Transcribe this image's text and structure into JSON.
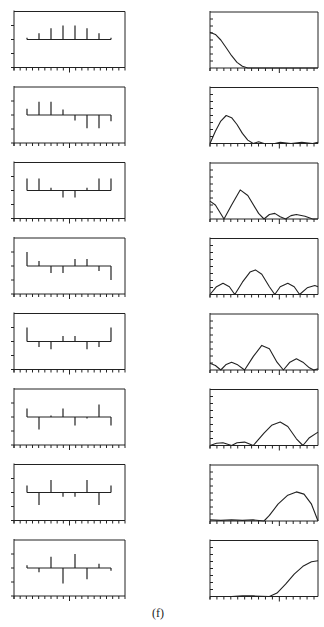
{
  "caption": "(f)",
  "chart_data": {
    "type": "line",
    "title": "",
    "layout": {
      "rows": 8,
      "columns": 2,
      "left_panel": "stem plot (8 samples)",
      "right_panel": "magnitude response curve"
    },
    "stems": [
      [
        0.12,
        0.45,
        0.8,
        1.0,
        1.0,
        0.8,
        0.45,
        0.12
      ],
      [
        0.45,
        0.95,
        0.95,
        0.4,
        -0.4,
        -0.95,
        -0.95,
        -0.45
      ],
      [
        0.85,
        0.85,
        0.2,
        -0.5,
        -0.5,
        0.2,
        0.85,
        0.85
      ],
      [
        1.0,
        0.35,
        -0.5,
        -0.5,
        0.5,
        0.5,
        -0.35,
        -1.0
      ],
      [
        1.0,
        -0.4,
        -0.55,
        0.4,
        0.4,
        -0.55,
        -0.4,
        1.0
      ],
      [
        0.6,
        -0.9,
        0.1,
        0.6,
        -0.6,
        -0.1,
        0.9,
        -0.6
      ],
      [
        0.5,
        -0.9,
        0.9,
        -0.3,
        -0.3,
        0.9,
        -0.9,
        0.5
      ],
      [
        0.2,
        -0.3,
        0.8,
        -1.1,
        1.0,
        -0.8,
        0.3,
        -0.2
      ]
    ],
    "responses": [
      [
        [
          0,
          0.64
        ],
        [
          0.05,
          0.6
        ],
        [
          0.1,
          0.5
        ],
        [
          0.15,
          0.36
        ],
        [
          0.2,
          0.22
        ],
        [
          0.25,
          0.1
        ],
        [
          0.3,
          0.03
        ],
        [
          0.35,
          0
        ],
        [
          1,
          0
        ]
      ],
      [
        [
          0,
          0
        ],
        [
          0.05,
          0.22
        ],
        [
          0.1,
          0.4
        ],
        [
          0.15,
          0.5
        ],
        [
          0.2,
          0.46
        ],
        [
          0.25,
          0.34
        ],
        [
          0.3,
          0.18
        ],
        [
          0.35,
          0.06
        ],
        [
          0.4,
          0
        ],
        [
          0.45,
          0.03
        ],
        [
          0.5,
          0
        ],
        [
          0.6,
          0
        ],
        [
          0.65,
          0.02
        ],
        [
          0.75,
          0
        ],
        [
          0.85,
          0.02
        ],
        [
          0.95,
          0
        ],
        [
          1,
          0.02
        ]
      ],
      [
        [
          0,
          0.32
        ],
        [
          0.05,
          0.25
        ],
        [
          0.13,
          0
        ],
        [
          0.2,
          0.25
        ],
        [
          0.28,
          0.52
        ],
        [
          0.35,
          0.42
        ],
        [
          0.45,
          0.1
        ],
        [
          0.5,
          0
        ],
        [
          0.55,
          0.08
        ],
        [
          0.6,
          0.1
        ],
        [
          0.65,
          0.04
        ],
        [
          0.7,
          0
        ],
        [
          0.75,
          0.06
        ],
        [
          0.8,
          0.08
        ],
        [
          0.88,
          0.05
        ],
        [
          0.95,
          0
        ],
        [
          1,
          0
        ]
      ],
      [
        [
          0,
          0
        ],
        [
          0.06,
          0.14
        ],
        [
          0.12,
          0.2
        ],
        [
          0.18,
          0.14
        ],
        [
          0.23,
          0
        ],
        [
          0.3,
          0.22
        ],
        [
          0.37,
          0.4
        ],
        [
          0.42,
          0.44
        ],
        [
          0.48,
          0.36
        ],
        [
          0.55,
          0.14
        ],
        [
          0.6,
          0
        ],
        [
          0.65,
          0.14
        ],
        [
          0.72,
          0.2
        ],
        [
          0.78,
          0.14
        ],
        [
          0.83,
          0
        ],
        [
          0.9,
          0.12
        ],
        [
          0.97,
          0.16
        ],
        [
          1,
          0.14
        ]
      ],
      [
        [
          0,
          0.12
        ],
        [
          0.05,
          0.08
        ],
        [
          0.1,
          0
        ],
        [
          0.15,
          0.1
        ],
        [
          0.2,
          0.14
        ],
        [
          0.25,
          0.1
        ],
        [
          0.32,
          0
        ],
        [
          0.4,
          0.24
        ],
        [
          0.48,
          0.44
        ],
        [
          0.55,
          0.38
        ],
        [
          0.62,
          0.14
        ],
        [
          0.68,
          0
        ],
        [
          0.74,
          0.14
        ],
        [
          0.8,
          0.2
        ],
        [
          0.86,
          0.14
        ],
        [
          0.92,
          0.04
        ],
        [
          0.96,
          0
        ],
        [
          1,
          0.02
        ]
      ],
      [
        [
          0,
          0
        ],
        [
          0.06,
          0.04
        ],
        [
          0.12,
          0.05
        ],
        [
          0.2,
          0
        ],
        [
          0.25,
          0.05
        ],
        [
          0.32,
          0.06
        ],
        [
          0.4,
          0
        ],
        [
          0.5,
          0.22
        ],
        [
          0.57,
          0.36
        ],
        [
          0.65,
          0.42
        ],
        [
          0.72,
          0.34
        ],
        [
          0.8,
          0.12
        ],
        [
          0.86,
          0
        ],
        [
          0.92,
          0.14
        ],
        [
          1,
          0.24
        ]
      ],
      [
        [
          0,
          0.02
        ],
        [
          0.1,
          0.01
        ],
        [
          0.2,
          0.02
        ],
        [
          0.3,
          0.01
        ],
        [
          0.4,
          0.02
        ],
        [
          0.5,
          0
        ],
        [
          0.55,
          0.1
        ],
        [
          0.63,
          0.3
        ],
        [
          0.72,
          0.46
        ],
        [
          0.8,
          0.52
        ],
        [
          0.87,
          0.48
        ],
        [
          0.94,
          0.3
        ],
        [
          1,
          0
        ]
      ],
      [
        [
          0,
          0
        ],
        [
          0.2,
          0
        ],
        [
          0.3,
          0.01
        ],
        [
          0.4,
          0.01
        ],
        [
          0.55,
          0
        ],
        [
          0.62,
          0.06
        ],
        [
          0.7,
          0.22
        ],
        [
          0.78,
          0.4
        ],
        [
          0.86,
          0.54
        ],
        [
          0.94,
          0.62
        ],
        [
          1,
          0.64
        ]
      ]
    ],
    "xlabel": "",
    "ylabel": "",
    "grid": false
  }
}
